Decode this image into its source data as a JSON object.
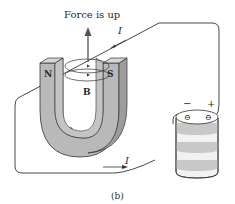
{
  "figure": {
    "caption": "(b)",
    "force_label": "Force is up",
    "field_label": "B",
    "magnet": {
      "north_label": "N",
      "south_label": "S"
    },
    "current_label_top": "I",
    "current_label_bottom": "I",
    "battery": {
      "negative_label": "−",
      "positive_label": "+",
      "terminal_glyph": "⊖"
    },
    "colors": {
      "magnet_face": "#b9b9b9",
      "magnet_side": "#a7a7a7",
      "magnet_top": "#d0d0d0",
      "battery_band": "#c8c8c8",
      "battery_light": "#f2f2f2",
      "wire": "#333333"
    }
  }
}
